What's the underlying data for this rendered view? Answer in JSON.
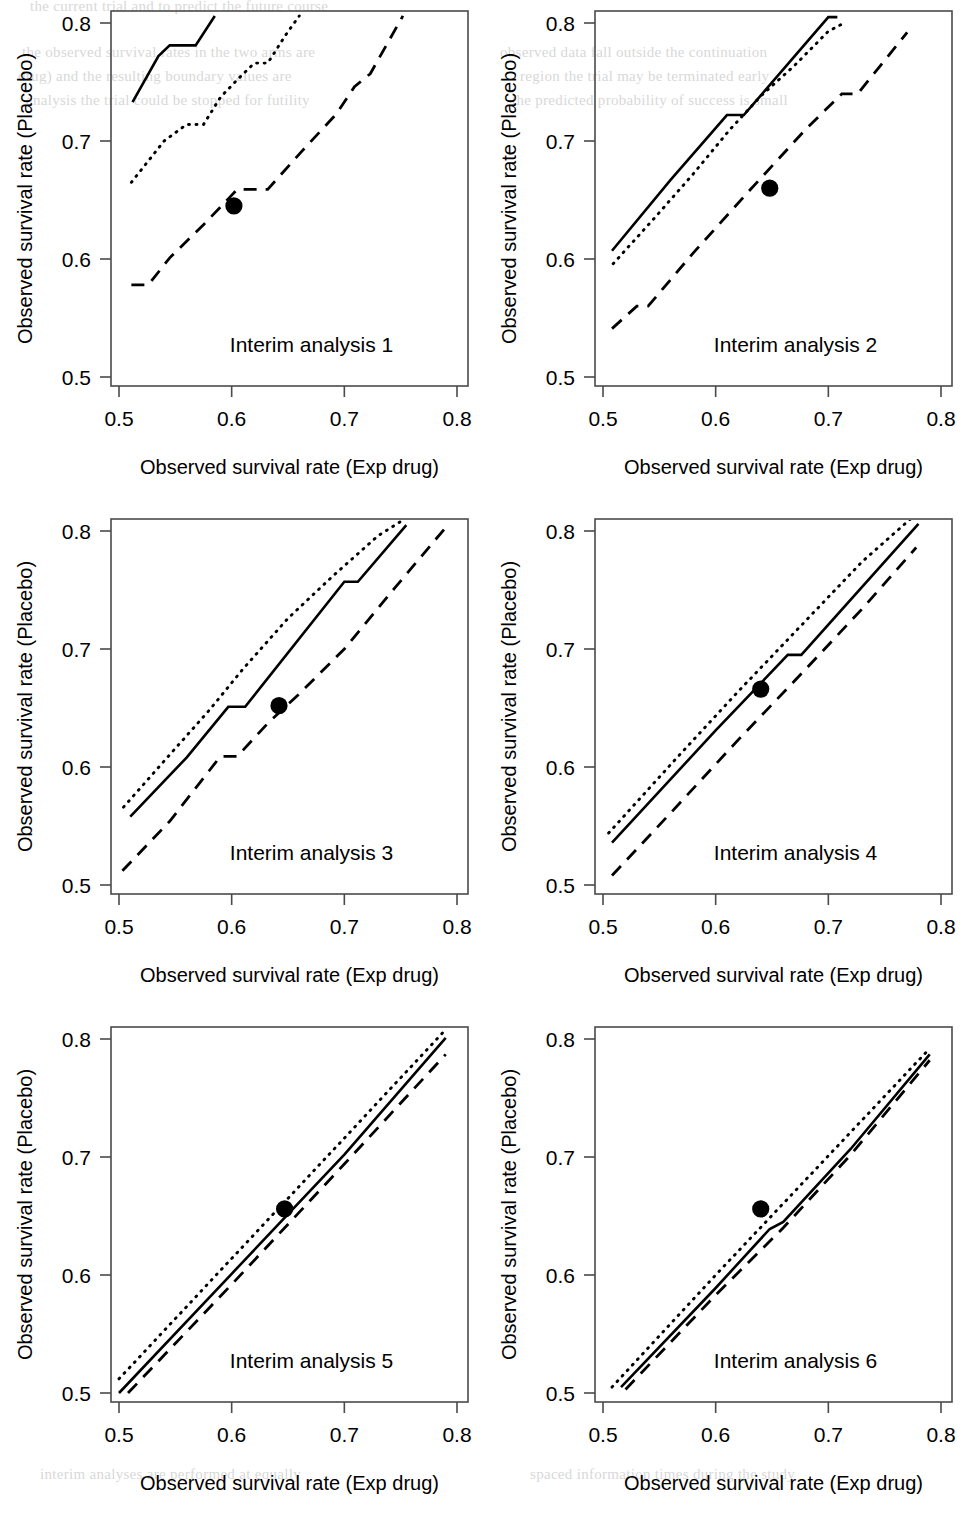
{
  "figure": {
    "panel_count": 6,
    "columns": 2,
    "rows": 3,
    "background": "#ffffff",
    "line_color": "#000000",
    "frame_color": "#4a4a4a"
  },
  "axis": {
    "xlabel": "Observed survival rate (Exp drug)",
    "ylabel": "Observed survival rate (Placebo)",
    "xticks": [
      0.5,
      0.6,
      0.7,
      0.8
    ],
    "yticks": [
      0.5,
      0.6,
      0.7,
      0.8
    ],
    "xtick_labels": [
      "0.5",
      "0.6",
      "0.7",
      "0.8"
    ],
    "ytick_labels": [
      "0.5",
      "0.6",
      "0.7",
      "0.8"
    ],
    "xlim": [
      0.49,
      0.815
    ],
    "ylim": [
      0.487,
      0.812
    ]
  },
  "titles": [
    "Interim analysis 1",
    "Interim analysis 2",
    "Interim analysis 3",
    "Interim analysis 4",
    "Interim analysis 5",
    "Interim analysis 6"
  ],
  "chart_data": {
    "type": "line",
    "title": "",
    "subtitle": "",
    "xlabel": "Observed survival rate (Exp drug)",
    "ylabel": "Observed survival rate (Placebo)",
    "xlim": [
      0.49,
      0.815
    ],
    "ylim": [
      0.487,
      0.812
    ],
    "grid": false,
    "legend": "none",
    "series_names": [
      "upper boundary (solid)",
      "middle boundary (dotted)",
      "lower boundary (dashed)",
      "observed point (filled circle)"
    ],
    "panels": [
      {
        "title": "Interim analysis 1",
        "series": [
          {
            "name": "upper boundary (solid)",
            "style": "solid",
            "x": [
              0.512,
              0.535,
              0.545,
              0.568,
              0.585
            ],
            "y": [
              0.733,
              0.772,
              0.781,
              0.781,
              0.806
            ]
          },
          {
            "name": "middle boundary (dotted)",
            "style": "dotted",
            "x": [
              0.511,
              0.54,
              0.56,
              0.575,
              0.59,
              0.605,
              0.62,
              0.632,
              0.648,
              0.66
            ],
            "y": [
              0.665,
              0.7,
              0.714,
              0.714,
              0.737,
              0.752,
              0.766,
              0.766,
              0.79,
              0.806
            ]
          },
          {
            "name": "lower boundary (dashed)",
            "style": "dashed",
            "x": [
              0.511,
              0.526,
              0.545,
              0.575,
              0.598,
              0.605,
              0.632,
              0.662,
              0.693,
              0.709,
              0.723,
              0.752
            ],
            "y": [
              0.578,
              0.578,
              0.601,
              0.629,
              0.652,
              0.659,
              0.659,
              0.691,
              0.723,
              0.746,
              0.757,
              0.806
            ]
          }
        ],
        "point": {
          "x": 0.602,
          "y": 0.645
        }
      },
      {
        "title": "Interim analysis 2",
        "series": [
          {
            "name": "upper boundary (solid)",
            "style": "solid",
            "x": [
              0.508,
              0.56,
              0.61,
              0.625,
              0.7,
              0.708
            ],
            "y": [
              0.607,
              0.667,
              0.722,
              0.722,
              0.805,
              0.805
            ]
          },
          {
            "name": "middle boundary (dotted)",
            "style": "dotted",
            "x": [
              0.509,
              0.545,
              0.58,
              0.612,
              0.64,
              0.67,
              0.7,
              0.712
            ],
            "y": [
              0.596,
              0.634,
              0.672,
              0.709,
              0.738,
              0.764,
              0.793,
              0.799
            ]
          },
          {
            "name": "lower boundary (dashed)",
            "style": "dashed",
            "x": [
              0.508,
              0.53,
              0.54,
              0.58,
              0.63,
              0.68,
              0.712,
              0.726,
              0.77
            ],
            "y": [
              0.541,
              0.56,
              0.56,
              0.605,
              0.658,
              0.71,
              0.74,
              0.74,
              0.792
            ]
          }
        ],
        "point": {
          "x": 0.648,
          "y": 0.66
        }
      },
      {
        "title": "Interim analysis 3",
        "series": [
          {
            "name": "upper boundary (solid)",
            "style": "solid",
            "x": [
              0.51,
              0.56,
              0.597,
              0.612,
              0.7,
              0.712,
              0.755
            ],
            "y": [
              0.558,
              0.608,
              0.651,
              0.651,
              0.757,
              0.757,
              0.805
            ]
          },
          {
            "name": "middle boundary (dotted)",
            "style": "dotted",
            "x": [
              0.504,
              0.54,
              0.58,
              0.61,
              0.65,
              0.69,
              0.73,
              0.75
            ],
            "y": [
              0.566,
              0.605,
              0.648,
              0.683,
              0.726,
              0.762,
              0.796,
              0.808
            ]
          },
          {
            "name": "lower boundary (dashed)",
            "style": "dashed",
            "x": [
              0.503,
              0.545,
              0.59,
              0.605,
              0.632,
              0.66,
              0.7,
              0.745,
              0.79
            ],
            "y": [
              0.512,
              0.554,
              0.609,
              0.609,
              0.637,
              0.662,
              0.7,
              0.752,
              0.803
            ]
          }
        ],
        "point": {
          "x": 0.642,
          "y": 0.652
        }
      },
      {
        "title": "Interim analysis 4",
        "series": [
          {
            "name": "upper boundary (solid)",
            "style": "solid",
            "x": [
              0.508,
              0.6,
              0.664,
              0.676,
              0.78
            ],
            "y": [
              0.536,
              0.631,
              0.695,
              0.695,
              0.806
            ]
          },
          {
            "name": "middle boundary (dotted)",
            "style": "dotted",
            "x": [
              0.505,
              0.56,
              0.62,
              0.68,
              0.73,
              0.775
            ],
            "y": [
              0.544,
              0.602,
              0.664,
              0.724,
              0.774,
              0.812
            ]
          },
          {
            "name": "lower boundary (dashed)",
            "style": "dashed",
            "x": [
              0.508,
              0.56,
              0.62,
              0.68,
              0.73,
              0.778
            ],
            "y": [
              0.508,
              0.561,
              0.623,
              0.683,
              0.734,
              0.786
            ]
          }
        ],
        "point": {
          "x": 0.64,
          "y": 0.666
        }
      },
      {
        "title": "Interim analysis 5",
        "series": [
          {
            "name": "upper boundary (solid)",
            "style": "solid",
            "x": [
              0.5,
              0.6,
              0.7,
              0.79
            ],
            "y": [
              0.5,
              0.601,
              0.702,
              0.801
            ]
          },
          {
            "name": "middle boundary (dotted)",
            "style": "dotted",
            "x": [
              0.5,
              0.6,
              0.7,
              0.788
            ],
            "y": [
              0.512,
              0.614,
              0.716,
              0.806
            ]
          },
          {
            "name": "lower boundary (dashed)",
            "style": "dashed",
            "x": [
              0.508,
              0.6,
              0.7,
              0.79
            ],
            "y": [
              0.5,
              0.592,
              0.694,
              0.787
            ]
          }
        ],
        "point": {
          "x": 0.647,
          "y": 0.656
        }
      },
      {
        "title": "Interim analysis 6",
        "series": [
          {
            "name": "upper boundary (solid)",
            "style": "solid",
            "x": [
              0.516,
              0.6,
              0.648,
              0.66,
              0.72,
              0.79
            ],
            "y": [
              0.505,
              0.589,
              0.639,
              0.645,
              0.707,
              0.787
            ]
          },
          {
            "name": "middle boundary (dotted)",
            "style": "dotted",
            "x": [
              0.508,
              0.6,
              0.7,
              0.79
            ],
            "y": [
              0.505,
              0.6,
              0.701,
              0.792
            ]
          },
          {
            "name": "lower boundary (dashed)",
            "style": "dashed",
            "x": [
              0.52,
              0.6,
              0.66,
              0.72,
              0.79
            ],
            "y": [
              0.503,
              0.583,
              0.64,
              0.702,
              0.782
            ]
          }
        ],
        "point": {
          "x": 0.64,
          "y": 0.656
        }
      }
    ]
  },
  "background_bleed": {
    "note": "faint show-through text from reverse page",
    "lines": [
      "the current trial and to predict the future course",
      "the observed survival rates in the two arms are",
      "drug) and the resulting boundary values are",
      "analysis the trial could be stopped for futility",
      "observed data fall outside the continuation",
      "region the trial may be terminated early",
      "the predicted probability of success is small",
      "interim analyses are performed at equally",
      "spaced information times during the study"
    ]
  }
}
